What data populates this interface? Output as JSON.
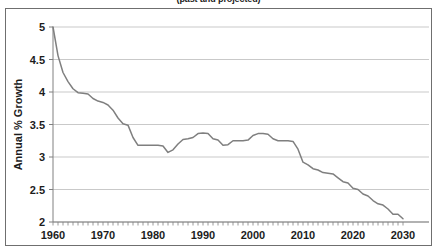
{
  "chart_data": {
    "type": "line",
    "title": "(past and projected)",
    "title_note": "top line of title is cropped off above the image edge",
    "xlabel": "",
    "ylabel": "Annual % Growth",
    "xlim": [
      1960,
      2030
    ],
    "ylim": [
      2,
      5
    ],
    "xticks": [
      1960,
      1970,
      1980,
      1990,
      2000,
      2010,
      2020,
      2030
    ],
    "xtick_labels": [
      "1960",
      "1970",
      "1980",
      "1990",
      "2000",
      "2010",
      "2020",
      "2030"
    ],
    "yticks": [
      2,
      2.5,
      3,
      3.5,
      4,
      4.5,
      5
    ],
    "ytick_labels": [
      "2",
      "2.5",
      "3",
      "3.5",
      "4",
      "4.5",
      "5"
    ],
    "minor_xticks_every": 1,
    "grid": "horizontal-only",
    "legend": "none",
    "line_color": "#7f7f7f",
    "grid_color": "#c9c9c9",
    "axis_color": "#808080",
    "background": "#ffffff",
    "series": [
      {
        "name": "Annual % Growth",
        "x": [
          1960,
          1961,
          1962,
          1963,
          1964,
          1965,
          1966,
          1967,
          1968,
          1969,
          1970,
          1971,
          1972,
          1973,
          1974,
          1975,
          1976,
          1977,
          1978,
          1979,
          1980,
          1981,
          1982,
          1983,
          1984,
          1985,
          1986,
          1987,
          1988,
          1989,
          1990,
          1991,
          1992,
          1993,
          1994,
          1995,
          1996,
          1997,
          1998,
          1999,
          2000,
          2001,
          2002,
          2003,
          2004,
          2005,
          2006,
          2007,
          2008,
          2009,
          2010,
          2011,
          2012,
          2013,
          2014,
          2015,
          2016,
          2017,
          2018,
          2019,
          2020,
          2021,
          2022,
          2023,
          2024,
          2025,
          2026,
          2027,
          2028,
          2029,
          2030
        ],
        "values": [
          5.0,
          4.56,
          4.3,
          4.16,
          4.05,
          3.99,
          3.98,
          3.97,
          3.9,
          3.86,
          3.84,
          3.8,
          3.72,
          3.6,
          3.51,
          3.49,
          3.3,
          3.18,
          3.18,
          3.18,
          3.18,
          3.18,
          3.17,
          3.07,
          3.11,
          3.2,
          3.27,
          3.28,
          3.3,
          3.36,
          3.37,
          3.36,
          3.28,
          3.26,
          3.18,
          3.19,
          3.25,
          3.25,
          3.25,
          3.26,
          3.33,
          3.36,
          3.36,
          3.35,
          3.28,
          3.25,
          3.25,
          3.25,
          3.24,
          3.12,
          2.92,
          2.88,
          2.82,
          2.8,
          2.76,
          2.75,
          2.74,
          2.68,
          2.62,
          2.6,
          2.52,
          2.5,
          2.43,
          2.4,
          2.33,
          2.28,
          2.26,
          2.2,
          2.12,
          2.12,
          2.05
        ]
      }
    ]
  }
}
